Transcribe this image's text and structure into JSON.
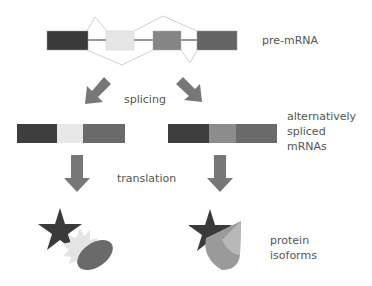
{
  "labels": {
    "pre_mrna": "pre-mRNA",
    "splicing": "splicing",
    "alt_spliced_line1": "alternatively",
    "alt_spliced_line2": "spliced",
    "alt_spliced_line3": "mRNAs",
    "translation": "translation",
    "protein_line1": "protein",
    "protein_line2": "isoforms"
  },
  "colors": {
    "exon1": "#3a3a3a",
    "exon2": "#e6e6e6",
    "exon3": "#858585",
    "exon4": "#646464",
    "arrow": "#777777",
    "splice_line": "#cfcfcf",
    "intron_line": "#333333",
    "text": "#555555"
  },
  "pre_mrna_exons": [
    "exon-1",
    "exon-2",
    "exon-3",
    "exon-4"
  ],
  "mrna_isoforms": [
    {
      "exons": [
        "exon-1",
        "exon-2",
        "exon-4"
      ]
    },
    {
      "exons": [
        "exon-1",
        "exon-3",
        "exon-4"
      ]
    }
  ]
}
